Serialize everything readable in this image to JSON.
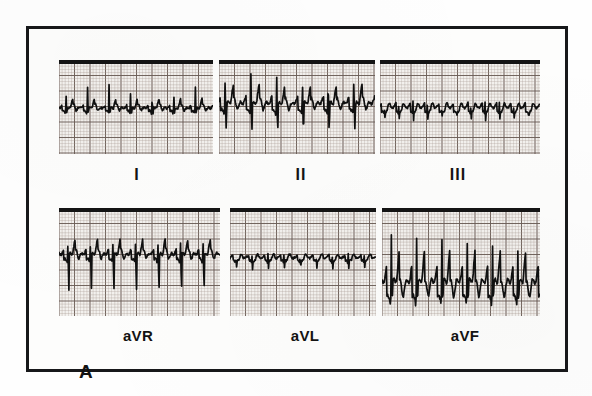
{
  "figure": {
    "panel_letter": "A",
    "caption_text": "",
    "frame_color": "#17181a",
    "paper_color": "#f3f1ee",
    "trace_color": "#101010",
    "grid_fine_color": "#a89a92",
    "grid_bold_color": "#6d5f58"
  },
  "layout": {
    "frame": {
      "x": 26,
      "y": 26,
      "width": 542,
      "height": 346
    },
    "rows": [
      {
        "name": "top-row",
        "y": 57,
        "height": 94
      },
      {
        "name": "bottom-row",
        "y": 205,
        "height": 108
      }
    ]
  },
  "leads": [
    {
      "id": "lead-i",
      "label": "I",
      "label_style": "roman",
      "row": "top",
      "panel": {
        "x": 56,
        "y": 57,
        "width": 154,
        "height": 94
      },
      "label_pos": {
        "x": 134,
        "y": 163
      },
      "baseline_pct": 52,
      "description": "Narrow QRS, regular rate, small upright R waves with flutter-like undulating baseline"
    },
    {
      "id": "lead-ii",
      "label": "II",
      "label_style": "roman",
      "row": "top",
      "panel": {
        "x": 216,
        "y": 57,
        "width": 156,
        "height": 94
      },
      "label_pos": {
        "x": 298,
        "y": 163
      },
      "baseline_pct": 48,
      "description": "Tall upright R waves with deep S waves and sawtooth flutter waves between complexes"
    },
    {
      "id": "lead-iii",
      "label": "III",
      "label_style": "roman",
      "row": "top",
      "panel": {
        "x": 377,
        "y": 57,
        "width": 160,
        "height": 94
      },
      "label_pos": {
        "x": 455,
        "y": 163
      },
      "baseline_pct": 52,
      "description": "Low amplitude continuous sawtooth flutter waves, small QRS complexes"
    },
    {
      "id": "lead-avr",
      "label": "aVR",
      "label_style": "alpha",
      "row": "bottom",
      "panel": {
        "x": 56,
        "y": 205,
        "width": 161,
        "height": 108
      },
      "label_pos": {
        "x": 135,
        "y": 324
      },
      "baseline_pct": 44,
      "description": "Predominantly negative QRS complexes with deep S waves, typical aVR morphology"
    },
    {
      "id": "lead-avl",
      "label": "aVL",
      "label_style": "alpha",
      "row": "bottom",
      "panel": {
        "x": 227,
        "y": 205,
        "width": 146,
        "height": 108
      },
      "label_pos": {
        "x": 302,
        "y": 324
      },
      "baseline_pct": 47,
      "description": "Very low amplitude, nearly isoelectric tracing with small undulations"
    },
    {
      "id": "lead-avf",
      "label": "aVF",
      "label_style": "alpha",
      "row": "bottom",
      "panel": {
        "x": 379,
        "y": 205,
        "width": 158,
        "height": 108
      },
      "label_pos": {
        "x": 462,
        "y": 324
      },
      "baseline_pct": 72,
      "description": "Very tall spiky R waves with large amplitude, prominent sawtooth flutter baseline"
    }
  ],
  "chart_data": {
    "type": "line",
    "title": "",
    "xlabel": "",
    "ylabel": "",
    "grid": true,
    "legend_position": "none",
    "grid_spec": {
      "fine_mm_px": 3.1,
      "bold_every": 5,
      "fine_color": "#a89a92",
      "bold_color": "#6d5f58"
    },
    "series": [
      {
        "name": "I",
        "baseline_pct": 52,
        "beats": 7,
        "beat_period_pct": 14.0,
        "beat_offset_pct": 2.0,
        "r_amp_pct": 30,
        "q_amp_pct": 3,
        "s_amp_pct": 5,
        "t_amp_pct": 7,
        "flutter_amp_pct": 4.5,
        "flutter_rate_per_period": 2.0,
        "noise_pct": 1.2
      },
      {
        "name": "II",
        "baseline_pct": 48,
        "beats": 6,
        "beat_period_pct": 16.5,
        "beat_offset_pct": 1.0,
        "r_amp_pct": 40,
        "q_amp_pct": 4,
        "s_amp_pct": 26,
        "t_amp_pct": 12,
        "flutter_amp_pct": 11,
        "flutter_rate_per_period": 2.0,
        "noise_pct": 1.4
      },
      {
        "name": "III",
        "baseline_pct": 52,
        "beats": 11,
        "beat_period_pct": 9.0,
        "beat_offset_pct": 1.0,
        "r_amp_pct": 13,
        "q_amp_pct": 2,
        "s_amp_pct": 8,
        "t_amp_pct": 4,
        "flutter_amp_pct": 7,
        "flutter_rate_per_period": 1.0,
        "noise_pct": 1.0
      },
      {
        "name": "aVR",
        "baseline_pct": 44,
        "beats": 7,
        "beat_period_pct": 14.0,
        "beat_offset_pct": 3.0,
        "r_amp_pct": 14,
        "q_amp_pct": 3,
        "s_amp_pct": 34,
        "t_amp_pct": 9,
        "flutter_amp_pct": 7,
        "flutter_rate_per_period": 2.0,
        "noise_pct": 1.2
      },
      {
        "name": "aVL",
        "baseline_pct": 47,
        "beats": 9,
        "beat_period_pct": 11.0,
        "beat_offset_pct": 2.0,
        "r_amp_pct": 8,
        "q_amp_pct": 2,
        "s_amp_pct": 7,
        "t_amp_pct": 3,
        "flutter_amp_pct": 4,
        "flutter_rate_per_period": 1.0,
        "noise_pct": 1.0
      },
      {
        "name": "aVF",
        "baseline_pct": 72,
        "beats": 6,
        "beat_period_pct": 16.0,
        "beat_offset_pct": 3.0,
        "r_amp_pct": 62,
        "q_amp_pct": 6,
        "s_amp_pct": 12,
        "t_amp_pct": 14,
        "flutter_amp_pct": 22,
        "flutter_rate_per_period": 2.0,
        "noise_pct": 1.6
      }
    ]
  }
}
